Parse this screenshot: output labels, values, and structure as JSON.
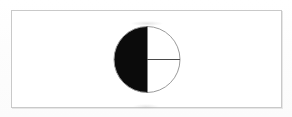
{
  "document": {
    "title": "Half-shaded circle diagram",
    "canvas_width": 292,
    "canvas_height": 117,
    "background_color": "#fefefe"
  },
  "frame": {
    "name": "diagram-border",
    "x": 11,
    "y": 10,
    "width": 271,
    "height": 98,
    "stroke_color": "#c9c9c9",
    "stroke_width": 1,
    "fill_color": "#ffffff"
  },
  "figure": {
    "label": "",
    "caption": "",
    "circle": {
      "center_x": 147,
      "center_y": 59.5,
      "radius": 33,
      "outline_color": "#9a9a9a",
      "outline_width": 1,
      "fill_color": "#ffffff"
    },
    "shaded_region": {
      "name": "left-half-shaded",
      "description": "left semicircle filled solid",
      "fill_color": "#0b0b0b",
      "fraction_shaded": "1/2",
      "percent_shaded": 50,
      "degrees": 180,
      "start_angle_deg": 90,
      "end_angle_deg": 270
    },
    "unshaded_region": {
      "name": "right-half-unshaded",
      "fill_color": "#ffffff",
      "fraction_unshaded": "1/2",
      "percent_unshaded": 50,
      "degrees": 180
    },
    "diameter_line": {
      "name": "vertical-diameter",
      "x1": 147,
      "y1": 26.5,
      "x2": 147,
      "y2": 92.5,
      "color": "#0b0b0b",
      "width": 1,
      "orientation": "vertical"
    },
    "radius_line": {
      "name": "horizontal-radius",
      "x1": 147,
      "y1": 59.5,
      "x2": 180,
      "y2": 59.5,
      "color": "#4a4a4a",
      "width": 1,
      "orientation": "horizontal",
      "description": "radius drawn from center to right edge splitting the unshaded half"
    },
    "colors": {
      "shaded": "#0b0b0b",
      "unshaded": "#ffffff",
      "outline": "#9a9a9a",
      "border": "#c9c9c9"
    }
  },
  "chart_data": {
    "type": "pie",
    "title": "",
    "xlabel": "",
    "ylabel": "",
    "labels": [
      "Shaded",
      "Unshaded"
    ],
    "values": [
      50,
      50
    ],
    "units": "percent",
    "colors": [
      "#0b0b0b",
      "#ffffff"
    ],
    "legend": "none",
    "grid": false,
    "annotations": [
      "vertical diameter separates shaded and unshaded halves",
      "horizontal radius drawn in the unshaded right half"
    ]
  }
}
